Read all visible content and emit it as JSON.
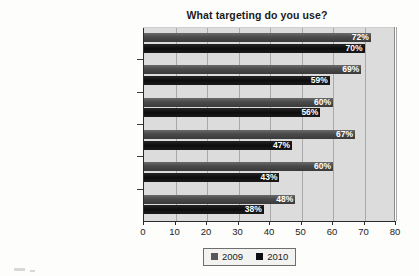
{
  "chart_data": {
    "type": "bar",
    "orientation": "horizontal",
    "title": "What targeting do you use?",
    "xlabel": "",
    "ylabel": "",
    "xlim": [
      0,
      80
    ],
    "xticks": [
      0,
      10,
      20,
      30,
      40,
      50,
      60,
      70,
      80
    ],
    "grid": true,
    "grid_axis": "x",
    "legend_position": "bottom",
    "value_suffix": "%",
    "categories": [
      "Data-driven demographic",
      "Behavioral",
      "Contextual",
      "Channel",
      "Geographic",
      "Re-targeting"
    ],
    "series": [
      {
        "name": "2009",
        "color": "#4a4a4a",
        "values": [
          72,
          69,
          60,
          67,
          60,
          48
        ],
        "labels": [
          "72%",
          "69%",
          "60%",
          "67%",
          "60%",
          "48%"
        ]
      },
      {
        "name": "2010",
        "color": "#0e0e0e",
        "values": [
          70,
          59,
          56,
          47,
          43,
          38
        ],
        "labels": [
          "70%",
          "59%",
          "56%",
          "47%",
          "43%",
          "38%"
        ]
      }
    ]
  },
  "legend": {
    "items": [
      {
        "label": "2009",
        "swatch": "gray-square-icon"
      },
      {
        "label": "2010",
        "swatch": "black-square-icon"
      }
    ]
  },
  "colors": {
    "series_2009": "#4a4a4a",
    "series_2010": "#0e0e0e",
    "plot_background": "#dcdcdc",
    "page_background": "#fdfdfc",
    "gridline": "#a9a9a9",
    "axis": "#2a2a2a",
    "text": "#1c1c1c",
    "value_label_text": "#ffffff"
  }
}
